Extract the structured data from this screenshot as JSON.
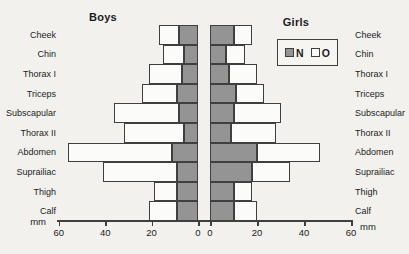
{
  "chart_data": {
    "type": "bar",
    "layout": "back-to-back-stacked-pyramid",
    "grid": false,
    "categories": [
      "Cheek",
      "Chin",
      "Thorax I",
      "Triceps",
      "Subscapular",
      "Thorax II",
      "Abdomen",
      "Suprailiac",
      "Thigh",
      "Calf"
    ],
    "axis": {
      "unit": "mm",
      "max": 60,
      "tick_step": 20
    },
    "panels": [
      {
        "id": "boys",
        "title": "Boys",
        "side": "left",
        "axis_ticks": [
          60,
          40,
          20,
          0
        ],
        "series": [
          {
            "name": "N",
            "values": [
              8,
              6,
              7,
              9,
              8,
              6,
              11,
              9,
              9,
              9
            ]
          },
          {
            "name": "O",
            "values": [
              9,
              9,
              14,
              15,
              28,
              26,
              45,
              32,
              10,
              12
            ]
          }
        ]
      },
      {
        "id": "girls",
        "title": "Girls",
        "side": "right",
        "axis_ticks": [
          0,
          20,
          40,
          60
        ],
        "series": [
          {
            "name": "N",
            "values": [
              10,
              7,
              8,
              11,
              10,
              9,
              20,
              18,
              10,
              10
            ]
          },
          {
            "name": "O",
            "values": [
              8,
              8,
              12,
              12,
              20,
              19,
              27,
              16,
              8,
              10
            ]
          }
        ]
      }
    ],
    "legend": {
      "items": [
        {
          "label": "N",
          "fill": "#949494"
        },
        {
          "label": "O",
          "fill": "#fbfbf9"
        }
      ]
    }
  },
  "colors": {
    "bar_border": "#3f3f3f",
    "n_fill": "#949494",
    "o_fill": "#fbfbf9",
    "background": "#f2f1ee"
  }
}
